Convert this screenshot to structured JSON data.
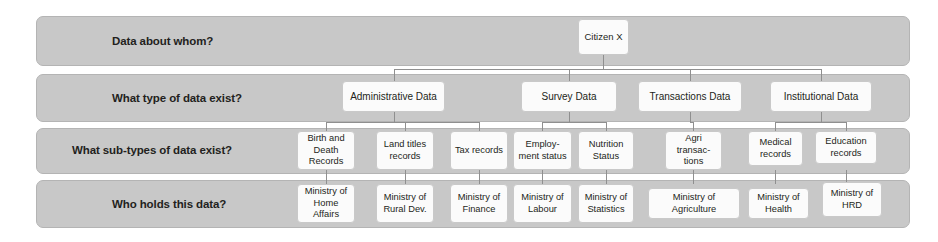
{
  "diagram": {
    "colors": {
      "band_fill": "#c8c8c8",
      "band_border": "#b4b4b4",
      "node_fill": "#fbfbfb",
      "node_border": "#c9c9c9",
      "connector": "#8f8f8f",
      "text": "#231f20",
      "page_background": "#ffffff"
    }
  },
  "rows": [
    {
      "id": "row-1",
      "label": "Data about whom?"
    },
    {
      "id": "row-2",
      "label": "What type of data exist?"
    },
    {
      "id": "row-3",
      "label": "What sub-types of data exist?"
    },
    {
      "id": "row-4",
      "label": "Who holds this data?"
    }
  ],
  "root": {
    "label": "Citizen X"
  },
  "data_types": [
    {
      "label": "Administrative Data"
    },
    {
      "label": "Survey Data"
    },
    {
      "label": "Transactions Data"
    },
    {
      "label": "Institutional Data"
    }
  ],
  "sub_types": [
    {
      "label": "Birth and Death Records"
    },
    {
      "label": "Land titles records"
    },
    {
      "label": "Tax records"
    },
    {
      "label": "Employ-ment status"
    },
    {
      "label": "Nutrition Status"
    },
    {
      "label": "Agri transac-tions"
    },
    {
      "label": "Medical records"
    },
    {
      "label": "Education records"
    }
  ],
  "holders": [
    {
      "label": "Ministry of Home Affairs"
    },
    {
      "label": "Ministry of Rural Dev."
    },
    {
      "label": "Ministry of Finance"
    },
    {
      "label": "Ministry of Labour"
    },
    {
      "label": "Ministry of Statistics"
    },
    {
      "label": "Ministry of Agriculture"
    },
    {
      "label": "Ministry of Health"
    },
    {
      "label": "Ministry of HRD"
    }
  ]
}
